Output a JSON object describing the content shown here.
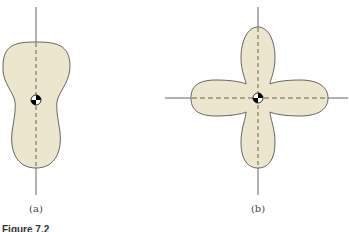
{
  "figure": {
    "caption": "Figure 7.2",
    "panels": [
      {
        "id": "a",
        "label": "(a)",
        "description": "Peanut-shaped body with vertical principal axis and center of gravity marker"
      },
      {
        "id": "b",
        "label": "(b)",
        "description": "Four-lobed cross-shaped body with vertical and horizontal principal axes and center of gravity marker"
      }
    ],
    "colors": {
      "fill": "#ece6cf",
      "outline": "#555555",
      "axis": "#555555",
      "dashed_axis": "#6b6346"
    }
  }
}
